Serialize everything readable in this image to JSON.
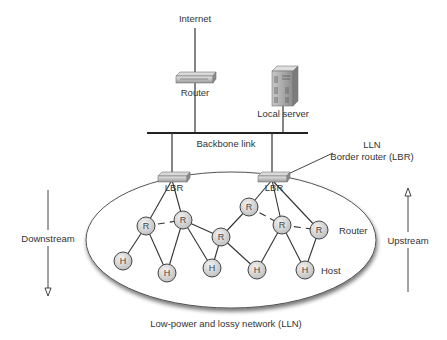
{
  "diagram": {
    "title_caption": "Low-power and lossy network (LLN)",
    "labels": {
      "internet": "Internet",
      "router": "Router",
      "local_server": "Local server",
      "backbone_link": "Backbone link",
      "lbr_callout_line1": "LLN",
      "lbr_callout_line2": "Border router (LBR)",
      "downstream": "Downstream",
      "upstream": "Upstream",
      "legend_router": "Router",
      "legend_host": "Host"
    },
    "border_routers": [
      {
        "id": "LBR1",
        "label": "LBR"
      },
      {
        "id": "LBR2",
        "label": "LBR"
      }
    ],
    "nodes": [
      {
        "id": "R1",
        "type": "router",
        "label": "R"
      },
      {
        "id": "R2",
        "type": "router",
        "label": "R"
      },
      {
        "id": "R3",
        "type": "router",
        "label": "R"
      },
      {
        "id": "R4",
        "type": "router",
        "label": "R"
      },
      {
        "id": "R5",
        "type": "router",
        "label": "R"
      },
      {
        "id": "R6",
        "type": "router",
        "label": "R"
      },
      {
        "id": "H0",
        "type": "host",
        "label": "H"
      },
      {
        "id": "H1",
        "type": "host",
        "label": "H"
      },
      {
        "id": "H2",
        "type": "host",
        "label": "H"
      },
      {
        "id": "H3",
        "type": "host",
        "label": "H"
      },
      {
        "id": "H4",
        "type": "host",
        "label": "H"
      }
    ],
    "edges": [
      {
        "from": "Internet",
        "to": "Router",
        "style": "solid"
      },
      {
        "from": "Router",
        "to": "Backbone",
        "style": "solid"
      },
      {
        "from": "Local server",
        "to": "Backbone",
        "style": "solid"
      },
      {
        "from": "Backbone",
        "to": "LBR1",
        "style": "solid"
      },
      {
        "from": "Backbone",
        "to": "LBR2",
        "style": "solid"
      },
      {
        "from": "LBR1",
        "to": "R1",
        "style": "solid"
      },
      {
        "from": "LBR1",
        "to": "R2",
        "style": "solid"
      },
      {
        "from": "LBR2",
        "to": "R4",
        "style": "solid"
      },
      {
        "from": "LBR2",
        "to": "R5",
        "style": "solid"
      },
      {
        "from": "LBR2",
        "to": "R6",
        "style": "solid"
      },
      {
        "from": "R1",
        "to": "R2",
        "style": "dashed"
      },
      {
        "from": "R4",
        "to": "R5",
        "style": "dashed"
      },
      {
        "from": "R5",
        "to": "R6",
        "style": "dashed"
      },
      {
        "from": "R2",
        "to": "R3",
        "style": "solid"
      },
      {
        "from": "R3",
        "to": "R4",
        "style": "solid"
      },
      {
        "from": "R1",
        "to": "H0",
        "style": "solid"
      },
      {
        "from": "R1",
        "to": "H1",
        "style": "solid"
      },
      {
        "from": "R2",
        "to": "H1",
        "style": "solid"
      },
      {
        "from": "R2",
        "to": "H2",
        "style": "solid"
      },
      {
        "from": "R3",
        "to": "H2",
        "style": "solid"
      },
      {
        "from": "R3",
        "to": "H3",
        "style": "solid"
      },
      {
        "from": "R5",
        "to": "H3",
        "style": "solid"
      },
      {
        "from": "R5",
        "to": "H4",
        "style": "solid"
      },
      {
        "from": "R6",
        "to": "H4",
        "style": "solid"
      }
    ]
  }
}
